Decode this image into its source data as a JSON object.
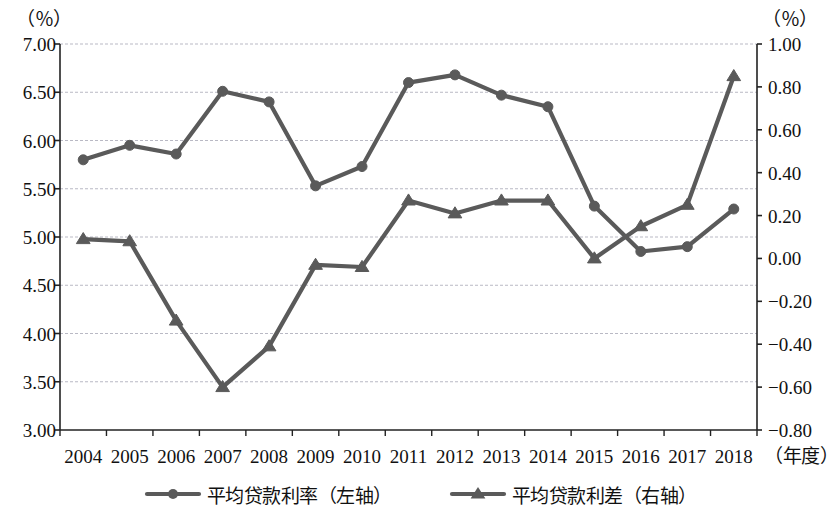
{
  "chart_data": {
    "type": "line",
    "title": "",
    "xlabel": "（年度）",
    "x_axis_unit": "（年度）",
    "categories": [
      "2004",
      "2005",
      "2006",
      "2007",
      "2008",
      "2009",
      "2010",
      "2011",
      "2012",
      "2013",
      "2014",
      "2015",
      "2016",
      "2017",
      "2018"
    ],
    "grid": true,
    "legend_position": "bottom",
    "axes": {
      "left": {
        "unit": "（％）",
        "ylim": [
          3.0,
          7.0
        ],
        "tick_step": 0.5,
        "ticks": [
          "7.00",
          "6.50",
          "6.00",
          "5.50",
          "5.00",
          "4.50",
          "4.00",
          "3.50",
          "3.00"
        ],
        "tick_values": [
          7.0,
          6.5,
          6.0,
          5.5,
          5.0,
          4.5,
          4.0,
          3.5,
          3.0
        ]
      },
      "right": {
        "unit": "（％）",
        "ylim": [
          -0.8,
          1.0
        ],
        "tick_step": 0.2,
        "ticks": [
          "1.00",
          "0.80",
          "0.60",
          "0.40",
          "0.20",
          "0.00",
          "−0.20",
          "−0.40",
          "−0.60",
          "−0.80"
        ],
        "tick_values": [
          1.0,
          0.8,
          0.6,
          0.4,
          0.2,
          0.0,
          -0.2,
          -0.4,
          -0.6,
          -0.8
        ]
      }
    },
    "series": [
      {
        "name": "平均贷款利率（左轴）",
        "axis": "left",
        "marker": "circle",
        "color": "#5a5a5a",
        "values": [
          5.8,
          5.95,
          5.86,
          6.51,
          6.4,
          5.53,
          5.73,
          6.6,
          6.68,
          6.47,
          6.35,
          5.32,
          4.85,
          4.9,
          5.29
        ]
      },
      {
        "name": "平均贷款利差（右轴）",
        "axis": "right",
        "marker": "triangle",
        "color": "#5a5a5a",
        "values": [
          0.09,
          0.08,
          -0.29,
          -0.6,
          -0.41,
          -0.03,
          -0.04,
          0.27,
          0.21,
          0.27,
          0.27,
          0.0,
          0.15,
          0.25,
          0.85
        ]
      }
    ]
  },
  "legend": {
    "items": [
      {
        "label": "平均贷款利率（左轴）",
        "marker": "circle"
      },
      {
        "label": "平均贷款利差（右轴）",
        "marker": "triangle"
      }
    ]
  },
  "style": {
    "line_color": "#5a5a5a",
    "axis_color": "#222222",
    "grid_color": "#b9b9c4",
    "text_color": "#111111",
    "background": "#ffffff"
  }
}
